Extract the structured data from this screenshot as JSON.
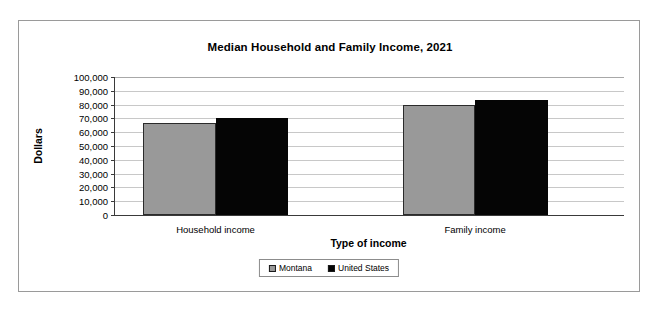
{
  "chart_data": {
    "type": "bar",
    "title": "Median Household and Family Income, 2021",
    "xlabel": "Type of income",
    "ylabel": "Dollars",
    "categories": [
      "Household income",
      "Family income"
    ],
    "series": [
      {
        "name": "Montana",
        "color": "#999999",
        "values": [
          66700,
          80000
        ]
      },
      {
        "name": "United States",
        "color": "#050505",
        "values": [
          70300,
          83000
        ]
      }
    ],
    "ylim": [
      0,
      100000
    ],
    "ytick_labels": [
      "100,000",
      "90,000",
      "80,000",
      "70,000",
      "60,000",
      "50,000",
      "40,000",
      "30,000",
      "20,000",
      "10,000",
      "0"
    ],
    "ytick_values": [
      100000,
      90000,
      80000,
      70000,
      60000,
      50000,
      40000,
      30000,
      20000,
      10000,
      0
    ],
    "grid": true,
    "legend_position": "bottom-center"
  },
  "legend": {
    "items": [
      {
        "label": "Montana"
      },
      {
        "label": "United States"
      }
    ]
  }
}
